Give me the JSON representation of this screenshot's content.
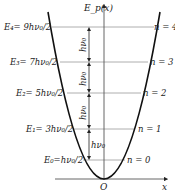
{
  "diagram": {
    "y_axis_label": "E_p(x)",
    "x_axis_label": "x",
    "origin_label": "O",
    "spacing_label": "hν₀",
    "levels": [
      {
        "n": 0,
        "energy_label": "E₀=hν₀/2",
        "n_label": "n = 0"
      },
      {
        "n": 1,
        "energy_label": "E₁= 3hν₀/2",
        "n_label": "n = 1"
      },
      {
        "n": 2,
        "energy_label": "E₂= 5hν₀/2",
        "n_label": "n = 2"
      },
      {
        "n": 3,
        "energy_label": "E₃= 7hν₀/2",
        "n_label": "n = 3"
      },
      {
        "n": 4,
        "energy_label": "E₄= 9hν₀/2",
        "n_label": "n = 4"
      }
    ],
    "colors": {
      "curve": "#111111",
      "level_line": "#9a9a9a",
      "axis": "#555555",
      "text": "#222222"
    }
  }
}
